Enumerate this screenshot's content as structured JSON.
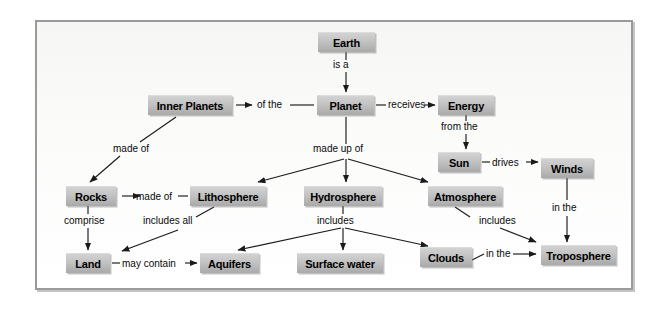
{
  "diagram": {
    "type": "concept-map",
    "frame": {
      "border_color": "#9a9a9a",
      "background": "#f7f7f5"
    },
    "node_style": {
      "fill_top": "#d2d2d2",
      "fill_bottom": "#a9a9a9",
      "text_color": "#000000"
    },
    "link_color": "#1a1a1a",
    "nodes": [
      {
        "id": "earth",
        "label": "Earth",
        "x": 318,
        "y": 32,
        "w": 57,
        "h": 20
      },
      {
        "id": "inner_planets",
        "label": "Inner Planets",
        "x": 148,
        "y": 95,
        "w": 84,
        "h": 20
      },
      {
        "id": "planet",
        "label": "Planet",
        "x": 317,
        "y": 95,
        "w": 57,
        "h": 20
      },
      {
        "id": "energy",
        "label": "Energy",
        "x": 438,
        "y": 95,
        "w": 56,
        "h": 20
      },
      {
        "id": "sun",
        "label": "Sun",
        "x": 438,
        "y": 152,
        "w": 42,
        "h": 20
      },
      {
        "id": "winds",
        "label": "Winds",
        "x": 541,
        "y": 158,
        "w": 52,
        "h": 20
      },
      {
        "id": "rocks",
        "label": "Rocks",
        "x": 66,
        "y": 186,
        "w": 50,
        "h": 20
      },
      {
        "id": "lithosphere",
        "label": "Lithosphere",
        "x": 190,
        "y": 186,
        "w": 76,
        "h": 20
      },
      {
        "id": "hydrosphere",
        "label": "Hydrosphere",
        "x": 304,
        "y": 186,
        "w": 78,
        "h": 20
      },
      {
        "id": "atmosphere",
        "label": "Atmosphere",
        "x": 428,
        "y": 186,
        "w": 74,
        "h": 20
      },
      {
        "id": "troposphere",
        "label": "Troposphere",
        "x": 541,
        "y": 245,
        "w": 75,
        "h": 20
      },
      {
        "id": "land",
        "label": "Land",
        "x": 66,
        "y": 253,
        "w": 44,
        "h": 20
      },
      {
        "id": "aquifers",
        "label": "Aquifers",
        "x": 200,
        "y": 253,
        "w": 59,
        "h": 20
      },
      {
        "id": "surface_water",
        "label": "Surface water",
        "x": 297,
        "y": 253,
        "w": 86,
        "h": 20
      },
      {
        "id": "clouds",
        "label": "Clouds",
        "x": 420,
        "y": 247,
        "w": 52,
        "h": 20
      }
    ],
    "links": [
      {
        "id": "earth-planet",
        "label": "is a",
        "from": "earth",
        "to": "planet",
        "lx": 333,
        "ly": 59
      },
      {
        "id": "planet-inner_planets",
        "label": "of the",
        "from": "planet",
        "to": "inner_planets",
        "lx": 257,
        "ly": 99
      },
      {
        "id": "planet-energy",
        "label": "receives",
        "from": "planet",
        "to": "energy",
        "lx": 380,
        "ly": 99
      },
      {
        "id": "energy-sun",
        "label": "from the",
        "from": "energy",
        "to": "sun",
        "lx": 441,
        "ly": 122
      },
      {
        "id": "sun-winds",
        "label": "drives",
        "from": "sun",
        "to": "winds",
        "lx": 492,
        "ly": 157
      },
      {
        "id": "winds-troposphere",
        "label": "in the",
        "from": "winds",
        "to": "troposphere",
        "lx": 552,
        "ly": 203
      },
      {
        "id": "inner_planets-rocks",
        "label": "made of",
        "from": "inner_planets",
        "to": "rocks",
        "lx": 113,
        "ly": 144
      },
      {
        "id": "planet-spheres",
        "label": "made up of",
        "from": "planet",
        "to": "hydrosphere",
        "lx": 316,
        "ly": 148
      },
      {
        "id": "lithosphere-rocks",
        "label": "made of",
        "from": "lithosphere",
        "to": "rocks",
        "lx": 132,
        "ly": 190
      },
      {
        "id": "rocks-land",
        "label": "comprise",
        "from": "rocks",
        "to": "land",
        "lx": 66,
        "ly": 219
      },
      {
        "id": "lithosphere-land",
        "label": "includes all",
        "from": "lithosphere",
        "to": "land",
        "lx": 143,
        "ly": 219
      },
      {
        "id": "land-aquifers",
        "label": "may contain",
        "from": "land",
        "to": "aquifers",
        "lx": 120,
        "ly": 258
      },
      {
        "id": "hydrosphere-includes",
        "label": "includes",
        "from": "hydrosphere",
        "to": "surface_water",
        "lx": 317,
        "ly": 219
      },
      {
        "id": "atmosphere-troposphere",
        "label": "includes",
        "from": "atmosphere",
        "to": "troposphere",
        "lx": 480,
        "ly": 219
      },
      {
        "id": "clouds-troposphere",
        "label": "in the",
        "from": "clouds",
        "to": "troposphere",
        "lx": 489,
        "ly": 249
      }
    ]
  }
}
